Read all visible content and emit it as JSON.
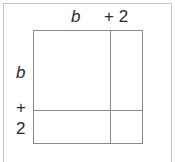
{
  "diagram": {
    "type": "area-model",
    "top_labels": {
      "first": "b",
      "second": "+ 2"
    },
    "side_labels": {
      "first": "b",
      "plus": "+",
      "second": "2"
    },
    "colors": {
      "frame_border": "#c4c4c4",
      "grid_lines": "#8a8a8a",
      "text": "#2a2a2a"
    }
  }
}
